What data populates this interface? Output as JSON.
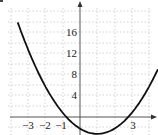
{
  "chart_data": {
    "type": "line",
    "title": "",
    "xlabel": "",
    "ylabel": "",
    "x_tick_labels": [
      "-3",
      "-2",
      "-1",
      "3"
    ],
    "y_tick_labels": [
      "4",
      "8",
      "12",
      "16"
    ],
    "xlim": [
      -4.7,
      4.5
    ],
    "ylim": [
      -3,
      21
    ],
    "grid": true,
    "legend": null,
    "series": [
      {
        "name": "parabola",
        "description": "Upward-opening parabola, approx. y = x^2 - 2x - 2.2, x-intercepts near -0.7 and 2.7, vertex near (1, -3)",
        "x": [
          -3.6,
          -3,
          -2,
          -1,
          0,
          1,
          2,
          3,
          4,
          4.5
        ],
        "y": [
          17.0,
          12.8,
          5.8,
          0.8,
          -2.2,
          -3.2,
          -2.2,
          0.8,
          5.8,
          9.0
        ]
      }
    ]
  },
  "labels": {
    "x": [
      "−3",
      "−2",
      "−1",
      "3"
    ],
    "y": [
      "4",
      "8",
      "12",
      "16"
    ]
  }
}
